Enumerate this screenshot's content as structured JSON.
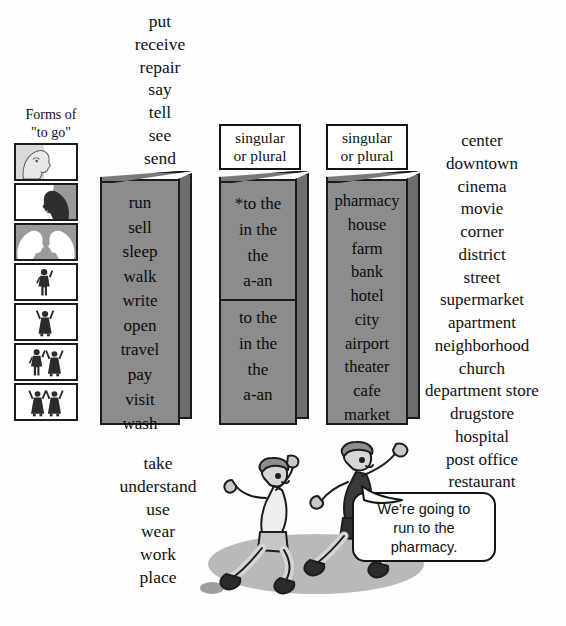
{
  "forms": {
    "label_line1": "Forms of",
    "label_line2": "\"to go\"",
    "icons": [
      {
        "name": "profile-light-facing-right",
        "meaning": "I"
      },
      {
        "name": "profile-dark-facing-left",
        "meaning": "you"
      },
      {
        "name": "two-profiles-facing-each-other",
        "meaning": "you-plural"
      },
      {
        "name": "male-figure-single",
        "meaning": "he"
      },
      {
        "name": "female-figure-single",
        "meaning": "she"
      },
      {
        "name": "male-and-female-figures",
        "meaning": "they-mixed"
      },
      {
        "name": "two-female-figures",
        "meaning": "they-plural"
      }
    ]
  },
  "top_verbs": [
    "put",
    "receive",
    "repair",
    "say",
    "tell",
    "see",
    "send"
  ],
  "slab_verbs": [
    "run",
    "sell",
    "sleep",
    "walk",
    "write",
    "open",
    "travel",
    "pay",
    "visit",
    "wash"
  ],
  "bottom_verbs": [
    "take",
    "understand",
    "use",
    "wear",
    "work",
    "place"
  ],
  "headers": {
    "singular_or_plural_1_line1": "singular",
    "singular_or_plural_1_line2": "or plural",
    "singular_or_plural_2_line1": "singular",
    "singular_or_plural_2_line2": "or plural"
  },
  "preposition_slab": {
    "top_half": [
      "*to the",
      "in the",
      "the",
      "a-an"
    ],
    "bottom_half": [
      "to the",
      "in the",
      "the",
      "a-an"
    ]
  },
  "place_slab": [
    "pharmacy",
    "house",
    "farm",
    "bank",
    "hotel",
    "city",
    "airport",
    "theater",
    "cafe",
    "market"
  ],
  "right_words": [
    "center",
    "downtown",
    "cinema",
    "movie",
    "corner",
    "district",
    "street",
    "supermarket",
    "apartment",
    "neighborhood",
    "church",
    "department store",
    "drugstore",
    "hospital",
    "post office",
    "restaurant"
  ],
  "speech_bubble": {
    "line1": "We're going to",
    "line2": "run to the",
    "line3": "pharmacy."
  },
  "colors": {
    "slab_face": "#8c8c8c",
    "slab_side": "#6d6d6d",
    "outline": "#1a1a1a",
    "background": "#fdfdfd",
    "shadow": "#b9b9b9"
  }
}
